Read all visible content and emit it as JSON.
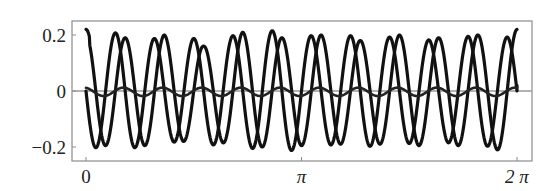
{
  "chart_data": {
    "type": "line",
    "title": "",
    "xlabel": "",
    "ylabel": "",
    "xlim": [
      -0.16,
      6.62
    ],
    "ylim": [
      -0.25,
      0.25
    ],
    "grid": false,
    "legend": null,
    "x_ticks": [
      {
        "value": 0,
        "label": "0"
      },
      {
        "value": 3.14159,
        "label": "π"
      },
      {
        "value": 6.28319,
        "label": "2 π"
      }
    ],
    "y_ticks": [
      {
        "value": 0.2,
        "label": "0.2"
      },
      {
        "value": 0,
        "label": "0"
      },
      {
        "value": -0.2,
        "label": "−0.2"
      }
    ],
    "zero_line": {
      "color": "#9a9a9a"
    },
    "frame_color": "#8c8c8c",
    "series": [
      {
        "name": "curve-a",
        "color": "#111111",
        "width": 3.2,
        "description": "large oscillation, ~11 cycles over [0, 2π], starts at 0.22, ends rising to ~0.23",
        "model": {
          "amp": [
            0.2,
            0.19,
            0.2,
            0.16,
            0.21,
            0.19,
            0.2,
            0.18,
            0.2,
            0.19,
            0.2,
            0.22
          ],
          "omega": 11,
          "phase": 0.0,
          "fn": "cos"
        }
      },
      {
        "name": "curve-b",
        "color": "#111111",
        "width": 3.2,
        "description": "large oscillation, phase-shifted from curve-a, starts at 0, ends near 0.02",
        "model": {
          "amp": [
            0.2,
            0.21,
            0.18,
            0.19,
            0.2,
            0.22,
            0.19,
            0.2,
            0.19,
            0.18,
            0.2,
            0.19
          ],
          "omega": 11,
          "phase": 0.0,
          "fn": "-sin"
        }
      },
      {
        "name": "curve-c",
        "color": "#222222",
        "width": 2.6,
        "description": "small oscillation around zero, amplitude ~0.015",
        "model": {
          "amp": [
            0.015
          ],
          "omega": 11,
          "phase": 0.3,
          "fn": "cos",
          "offset": -0.003
        }
      }
    ],
    "sample_points_x": [
      0,
      0.571,
      1.142,
      1.714,
      2.285,
      2.856,
      3.427,
      3.998,
      4.57,
      5.141,
      5.712,
      6.283
    ],
    "sample_values": {
      "curve-a": [
        0.22,
        0.19,
        0.2,
        0.16,
        0.21,
        0.19,
        0.2,
        0.18,
        0.2,
        0.19,
        0.2,
        0.23
      ],
      "curve-b": [
        0.0,
        0.0,
        0.0,
        0.0,
        0.0,
        0.0,
        0.0,
        0.0,
        0.0,
        0.0,
        0.0,
        0.02
      ],
      "curve-c": [
        0.012,
        0.012,
        0.012,
        0.012,
        0.012,
        0.012,
        0.012,
        0.012,
        0.012,
        0.012,
        0.012,
        0.012
      ]
    }
  },
  "plot": {
    "frame": {
      "left": 72,
      "top": 21,
      "right": 532,
      "bottom": 161
    },
    "x_pixels": {
      "zero": 86,
      "two_pi": 517
    },
    "y_pixels": {
      "zero": 91,
      "per_unit": 280
    }
  }
}
